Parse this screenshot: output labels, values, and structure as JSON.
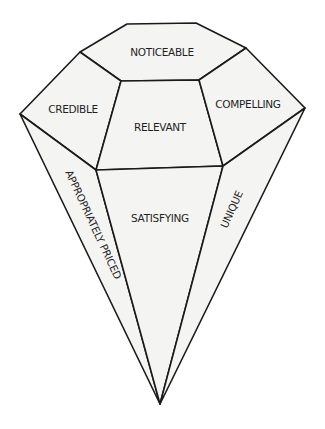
{
  "diagram": {
    "type": "gem-diagram",
    "colors": {
      "background": "#ffffff",
      "facet_fill": "#f4f4f2",
      "outline": "#1a1a1a",
      "text": "#1f1f1f"
    },
    "facets": {
      "top": {
        "label": "NOTICEABLE"
      },
      "upper_left": {
        "label": "CREDIBLE"
      },
      "center": {
        "label": "RELEVANT"
      },
      "upper_right": {
        "label": "COMPELLING"
      },
      "lower_left": {
        "label": "APPROPRIATELY PRICED"
      },
      "lower_center": {
        "label": "SATISFYING"
      },
      "lower_right": {
        "label": "UNIQUE"
      }
    }
  }
}
